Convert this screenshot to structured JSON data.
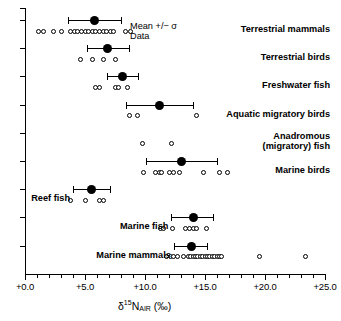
{
  "chart_data": {
    "type": "scatter",
    "title": "",
    "xlabel": "δ15NAIR (‰)",
    "ylabel": "",
    "xlim": [
      0,
      25
    ],
    "xtick_step": 1.0,
    "xtick_label_step": 5.0,
    "grid": false,
    "axis": {
      "tick_labels": [
        "+0.0",
        "+5.0",
        "+10.0",
        "+15.0",
        "+20.0",
        "+25.0"
      ],
      "tick_values": [
        0,
        5,
        10,
        15,
        20,
        25
      ],
      "label_delta": "δ",
      "label_sup": "15",
      "label_n": "N",
      "label_sub": "AIR",
      "label_units": "(‰)"
    },
    "legend": {
      "position": "top-center",
      "entries": [
        {
          "name": "mean-sigma",
          "label": "Mean +/− σ"
        },
        {
          "name": "data",
          "label": "Data"
        }
      ]
    },
    "categories": [
      {
        "label": "Terrestrial mammals",
        "label_lines": [
          "Terrestrial mammals"
        ],
        "label_side": "right",
        "mean": 5.8,
        "sd_low": 3.6,
        "sd_high": 8.0,
        "data": [
          1.1,
          1.5,
          2.4,
          3.0,
          3.8,
          4.1,
          4.4,
          4.7,
          5.0,
          5.3,
          5.6,
          5.9,
          6.2,
          6.5,
          6.8,
          7.1,
          7.4,
          8.4,
          8.8
        ]
      },
      {
        "label": "Terrestrial birds",
        "label_lines": [
          "Terrestrial birds"
        ],
        "label_side": "right",
        "mean": 6.9,
        "sd_low": 5.2,
        "sd_high": 8.7,
        "data": [
          4.6,
          5.6,
          6.5,
          7.5
        ]
      },
      {
        "label": "Freshwater fish",
        "label_lines": [
          "Freshwater fish"
        ],
        "label_side": "right",
        "mean": 8.1,
        "sd_low": 6.8,
        "sd_high": 9.4,
        "data": [
          5.9,
          6.2,
          7.5,
          7.8,
          8.5
        ]
      },
      {
        "label": "Aquatic migratory birds",
        "label_lines": [
          "Aquatic migratory birds"
        ],
        "label_side": "right",
        "mean": 11.2,
        "sd_low": 8.4,
        "sd_high": 14.0,
        "data": [
          8.7,
          9.4,
          14.3
        ]
      },
      {
        "label": "Anadromous (migratory) fish",
        "label_lines": [
          "Anadromous",
          "(migratory) fish"
        ],
        "label_side": "right",
        "mean": null,
        "sd_low": null,
        "sd_high": null,
        "data": [
          9.8,
          12.2
        ]
      },
      {
        "label": "Marine birds",
        "label_lines": [
          "Marine birds"
        ],
        "label_side": "right",
        "mean": 13.0,
        "sd_low": 10.1,
        "sd_high": 16.0,
        "data": [
          9.9,
          10.9,
          11.2,
          11.4,
          12.0,
          12.4,
          12.9,
          14.9,
          16.2,
          16.9
        ]
      },
      {
        "label": "Reef fish",
        "label_lines": [
          "Reef fish"
        ],
        "label_side": "left",
        "mean": 5.5,
        "sd_low": 4.0,
        "sd_high": 7.1,
        "data": [
          3.8,
          5.0,
          6.2,
          6.5
        ]
      },
      {
        "label": "Marine fish",
        "label_lines": [
          "Marine fish"
        ],
        "label_side": "left",
        "mean": 14.0,
        "sd_low": 12.2,
        "sd_high": 15.7,
        "data": [
          11.3,
          11.5,
          12.3,
          13.4,
          13.7,
          14.0,
          14.3,
          15.1
        ]
      },
      {
        "label": "Marine mammals",
        "label_lines": [
          "Marine mammals"
        ],
        "label_side": "left",
        "mean": 13.9,
        "sd_low": 12.4,
        "sd_high": 15.2,
        "data": [
          11.8,
          12.1,
          12.4,
          12.7,
          13.2,
          13.6,
          13.8,
          14.0,
          14.2,
          14.4,
          14.6,
          14.8,
          15.0,
          15.2,
          15.4,
          15.6,
          15.8,
          16.0,
          16.2,
          16.4,
          19.5,
          23.4
        ]
      }
    ]
  }
}
